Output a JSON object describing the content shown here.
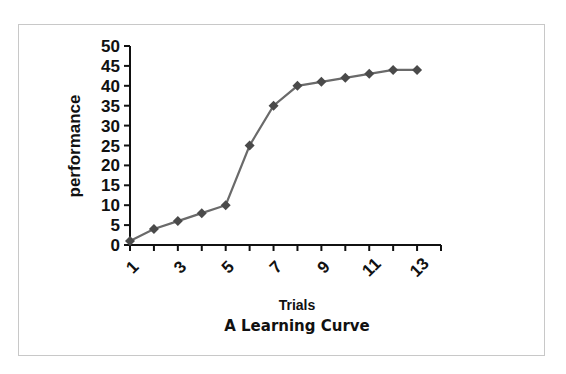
{
  "chart_data": {
    "type": "line",
    "title": "A Learning Curve",
    "xlabel": "Trials",
    "ylabel": "performance",
    "x": [
      1,
      2,
      3,
      4,
      5,
      6,
      7,
      8,
      9,
      10,
      11,
      12,
      13
    ],
    "x_tick_labels": [
      "1",
      "3",
      "5",
      "7",
      "9",
      "11",
      "13"
    ],
    "series": [
      {
        "name": "performance",
        "values": [
          1,
          4,
          6,
          8,
          10,
          25,
          35,
          40,
          41,
          42,
          43,
          44,
          44
        ]
      }
    ],
    "y_ticks": [
      0,
      5,
      10,
      15,
      20,
      25,
      30,
      35,
      40,
      45,
      50
    ],
    "ylim": [
      0,
      50
    ],
    "grid": false,
    "legend": "none",
    "colors": {
      "line": "#6a6a6a",
      "marker": "#4a4a4a",
      "axis": "#111111",
      "frame": "#c8c8c8"
    }
  }
}
